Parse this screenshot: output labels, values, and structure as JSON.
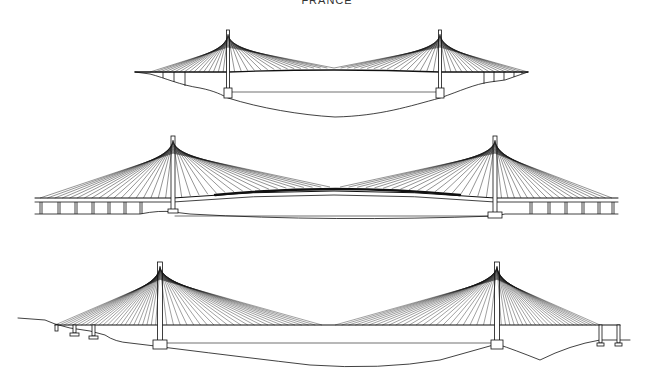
{
  "title": "FRANCE",
  "colors": {
    "line": "#111111",
    "background": "#ffffff"
  },
  "bridges": [
    {
      "id": "bridge-1",
      "towers": [
        {
          "x": 228,
          "top": 30,
          "base": 92
        },
        {
          "x": 440,
          "top": 30,
          "base": 92
        }
      ],
      "deck": {
        "x1": 135,
        "x2": 528,
        "y": 72,
        "midY": 70
      },
      "stays_per_side": 16,
      "side_span": {
        "left_end": 150,
        "right_end": 528
      }
    },
    {
      "id": "bridge-2",
      "towers": [
        {
          "x": 173,
          "top": 136,
          "base": 212
        },
        {
          "x": 495,
          "top": 136,
          "base": 216
        }
      ],
      "deck": {
        "x1": 35,
        "x2": 618,
        "y": 198,
        "midY": 188
      },
      "stays_per_side": 18,
      "approach_piers_left": [
        40,
        58,
        75,
        92,
        108,
        124,
        140
      ],
      "approach_piers_right": [
        530,
        548,
        565,
        582,
        598,
        612
      ]
    },
    {
      "id": "bridge-3",
      "towers": [
        {
          "x": 160,
          "top": 262,
          "base": 346
        },
        {
          "x": 497,
          "top": 262,
          "base": 346
        }
      ],
      "deck": {
        "x1": 55,
        "x2": 620,
        "y": 325,
        "midY": 325
      },
      "stays_per_side": 24,
      "approach_piers_left": [
        75,
        93
      ],
      "approach_piers_right": [
        600,
        617
      ]
    }
  ]
}
